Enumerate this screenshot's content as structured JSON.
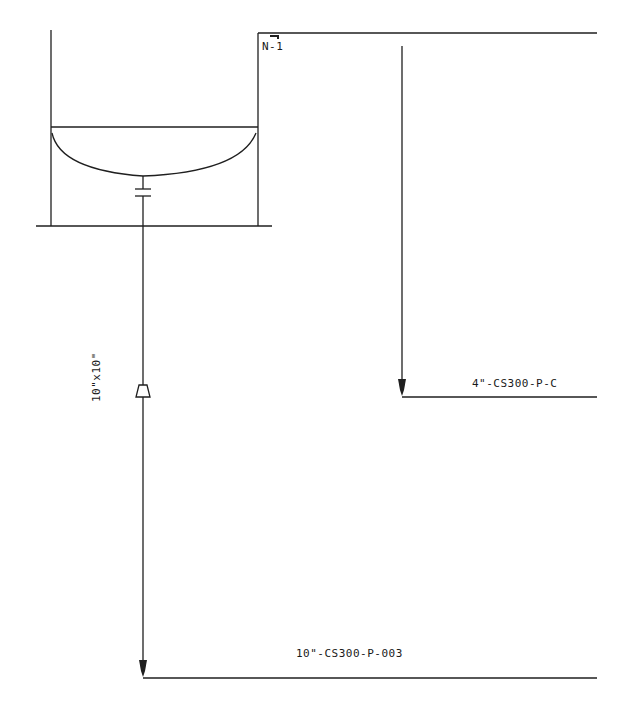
{
  "diagram": {
    "type": "piping_isometric_excerpt",
    "line_color": "#1f1f1f",
    "background": "#ffffff",
    "nozzle_label": "N-1",
    "reducer_label": "10\"x10\"",
    "pipe_labels": {
      "upper_line": "4\"-CS300-P-C",
      "lower_line": "10\"-CS300-P-003"
    }
  }
}
